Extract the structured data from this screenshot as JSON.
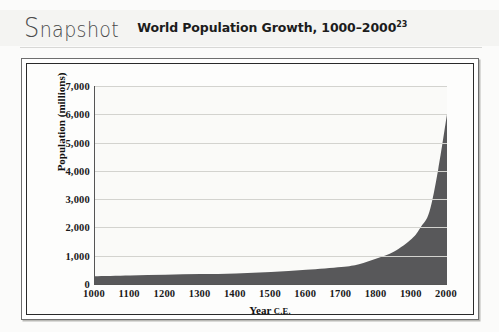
{
  "header": {
    "snapshot_cap": "S",
    "snapshot_rest": "napshot",
    "title": "World Population Growth, 1000–2000",
    "title_superscript": "23"
  },
  "colors": {
    "area_fill": "#58585a",
    "grid": "#d3d3cf",
    "axis": "#555555",
    "frame": "#2a2a2a",
    "header_band": "#f4f4f2",
    "plot_background": "#fafaf8"
  },
  "chart_data": {
    "type": "area",
    "title": "World Population Growth, 1000–2000",
    "xlabel_main": "Year",
    "xlabel_suffix": "C.E.",
    "ylabel": "Population (millions)",
    "xlim": [
      1000,
      2000
    ],
    "ylim": [
      0,
      7000
    ],
    "grid": true,
    "legend": "none",
    "xticks": [
      1000,
      1100,
      1200,
      1300,
      1400,
      1500,
      1600,
      1700,
      1800,
      1900,
      2000
    ],
    "xtick_labels": [
      "1000",
      "1100",
      "1200",
      "1300",
      "1400",
      "1500",
      "1600",
      "1700",
      "1800",
      "1900",
      "2000"
    ],
    "yticks": [
      0,
      1000,
      2000,
      3000,
      4000,
      5000,
      6000,
      7000
    ],
    "ytick_labels": [
      "0",
      "1,000",
      "2,000",
      "3,000",
      "4,000",
      "5,000",
      "6,000",
      "7,000"
    ],
    "x": [
      1000,
      1100,
      1200,
      1300,
      1400,
      1500,
      1600,
      1700,
      1750,
      1800,
      1850,
      1900,
      1925,
      1950,
      1975,
      2000
    ],
    "values": [
      275,
      300,
      325,
      350,
      375,
      425,
      500,
      600,
      700,
      900,
      1150,
      1600,
      2000,
      2550,
      4050,
      6000
    ],
    "series_name": "World population"
  }
}
